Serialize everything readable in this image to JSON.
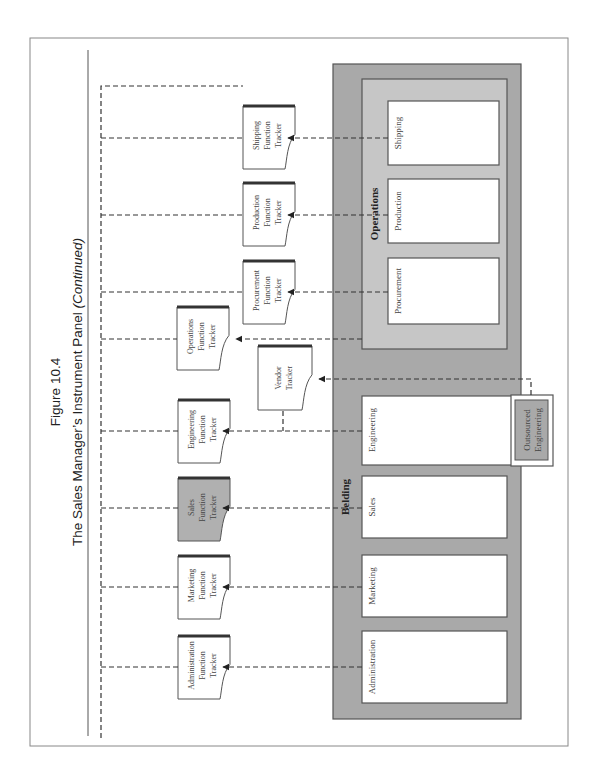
{
  "figure": {
    "number": "Figure 10.4",
    "title": "The Sales Manager’s Instrument Panel",
    "title_suffix": "(Continued)"
  },
  "organization": {
    "name": "Belding",
    "color_outer": "#a9a9a9",
    "color_inner": "#c4c4c4",
    "units": [
      {
        "id": "administration",
        "label": "Administration"
      },
      {
        "id": "marketing",
        "label": "Marketing"
      },
      {
        "id": "sales",
        "label": "Sales"
      },
      {
        "id": "engineering",
        "label": "Engineering"
      }
    ],
    "operations": {
      "name": "Operations",
      "units": [
        {
          "id": "procurement",
          "label": "Procurement"
        },
        {
          "id": "production",
          "label": "Production"
        },
        {
          "id": "shipping",
          "label": "Shipping"
        }
      ]
    },
    "outsourced": {
      "label_line1": "Outsourced",
      "label_line2": "Engineering"
    }
  },
  "trackers": [
    {
      "id": "administration",
      "line1": "Administration",
      "line2": "Function",
      "line3": "Tracker",
      "highlighted": false
    },
    {
      "id": "marketing",
      "line1": "Marketing",
      "line2": "Function",
      "line3": "Tracker",
      "highlighted": false
    },
    {
      "id": "sales",
      "line1": "Sales",
      "line2": "Function",
      "line3": "Tracker",
      "highlighted": true
    },
    {
      "id": "engineering",
      "line1": "Engineering",
      "line2": "Function",
      "line3": "Tracker",
      "highlighted": false
    },
    {
      "id": "operations",
      "line1": "Operations",
      "line2": "Function",
      "line3": "Tracker",
      "highlighted": false
    },
    {
      "id": "procurement",
      "line1": "Procurement",
      "line2": "Function",
      "line3": "Tracker",
      "highlighted": false
    },
    {
      "id": "production",
      "line1": "Production",
      "line2": "Function",
      "line3": "Tracker",
      "highlighted": false
    },
    {
      "id": "shipping",
      "line1": "Shipping",
      "line2": "Function",
      "line3": "Tracker",
      "highlighted": false
    }
  ],
  "vendor_tracker": {
    "line1": "Vendor",
    "line2": "Tracker"
  },
  "highlight_color": "#b0b0b0"
}
